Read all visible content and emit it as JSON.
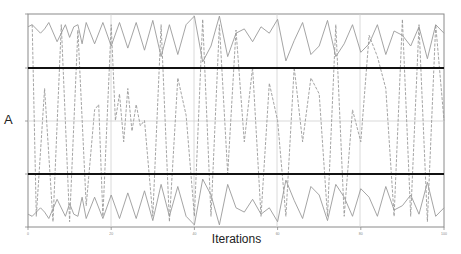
{
  "chart_data": {
    "type": "line",
    "title": "",
    "xlabel": "Iterations",
    "ylabel": "A",
    "xlim": [
      0,
      100
    ],
    "x_ticks": [
      0,
      20,
      40,
      60,
      80,
      100
    ],
    "ylim": [
      -1,
      1
    ],
    "grid": true,
    "legend": null,
    "reference_lines": [
      {
        "name": "upper-threshold",
        "y": 0.5,
        "style": "thick-black"
      },
      {
        "name": "center",
        "y": 0.0,
        "style": "thin-grey"
      },
      {
        "name": "lower-threshold",
        "y": -0.5,
        "style": "thick-black"
      }
    ],
    "series": [
      {
        "name": "upper-band-trace",
        "color": "#9a9a9a",
        "description": "sawtooth oscillation in upper band (A between ~0.55 and ~0.98)",
        "x": [
          0,
          1,
          3,
          4,
          5,
          7,
          9,
          10,
          11,
          12,
          13,
          14,
          16,
          18,
          20,
          22,
          24,
          26,
          28,
          30,
          32,
          34,
          36,
          38,
          40,
          42,
          44,
          46,
          48,
          50,
          52,
          54,
          56,
          58,
          60,
          62,
          64,
          66,
          68,
          70,
          72,
          74,
          76,
          78,
          80,
          82,
          84,
          86,
          88,
          90,
          92,
          94,
          96,
          98,
          100
        ],
        "values": [
          0.88,
          0.9,
          0.82,
          0.86,
          0.92,
          0.74,
          0.9,
          0.78,
          0.88,
          0.9,
          0.72,
          0.92,
          0.72,
          0.92,
          0.7,
          0.92,
          0.68,
          0.92,
          0.66,
          0.94,
          0.6,
          0.9,
          0.62,
          0.9,
          0.98,
          0.55,
          0.7,
          0.98,
          0.6,
          0.82,
          0.86,
          0.74,
          0.88,
          0.82,
          0.95,
          0.56,
          0.75,
          0.92,
          0.62,
          0.7,
          0.94,
          0.6,
          0.72,
          0.9,
          0.64,
          0.72,
          0.9,
          0.62,
          0.84,
          0.8,
          0.7,
          0.88,
          0.58,
          0.9,
          0.82
        ]
      },
      {
        "name": "lower-band-trace",
        "color": "#9a9a9a",
        "description": "mirrored sawtooth oscillation in lower band (A between ~-0.55 and ~-0.98)",
        "x": [
          0,
          1,
          3,
          4,
          5,
          7,
          9,
          10,
          11,
          12,
          13,
          14,
          16,
          18,
          20,
          22,
          24,
          26,
          28,
          30,
          32,
          34,
          36,
          38,
          40,
          42,
          44,
          46,
          48,
          50,
          52,
          54,
          56,
          58,
          60,
          62,
          64,
          66,
          68,
          70,
          72,
          74,
          76,
          78,
          80,
          82,
          84,
          86,
          88,
          90,
          92,
          94,
          96,
          98,
          100
        ],
        "values": [
          -0.88,
          -0.9,
          -0.82,
          -0.86,
          -0.92,
          -0.74,
          -0.9,
          -0.78,
          -0.88,
          -0.9,
          -0.72,
          -0.92,
          -0.72,
          -0.92,
          -0.7,
          -0.92,
          -0.68,
          -0.92,
          -0.66,
          -0.94,
          -0.6,
          -0.9,
          -0.62,
          -0.9,
          -0.98,
          -0.55,
          -0.7,
          -0.98,
          -0.6,
          -0.82,
          -0.86,
          -0.74,
          -0.88,
          -0.82,
          -0.95,
          -0.56,
          -0.75,
          -0.92,
          -0.62,
          -0.7,
          -0.94,
          -0.6,
          -0.72,
          -0.9,
          -0.64,
          -0.72,
          -0.9,
          -0.62,
          -0.84,
          -0.8,
          -0.7,
          -0.88,
          -0.58,
          -0.9,
          -0.82
        ]
      },
      {
        "name": "middle-trace",
        "color": "#9a9a9a",
        "style": "dashed",
        "description": "dashed vertical transitions jumping between the two bands, with some excursions in the middle region",
        "x": [
          1,
          2,
          4,
          6,
          8,
          10,
          12,
          14,
          16,
          17,
          18,
          20,
          21,
          22,
          23,
          24,
          25,
          26,
          27,
          28,
          30,
          32,
          34,
          36,
          38,
          40,
          42,
          44,
          46,
          48,
          50,
          52,
          54,
          56,
          58,
          60,
          62,
          64,
          66,
          68,
          70,
          72,
          74,
          76,
          78,
          80,
          82,
          84,
          86,
          88,
          90,
          92,
          94,
          96,
          98,
          100
        ],
        "values": [
          0.9,
          -0.9,
          0.3,
          -0.95,
          0.9,
          -0.95,
          0.85,
          -0.8,
          0.1,
          0.15,
          -0.9,
          0.9,
          0.0,
          0.25,
          -0.2,
          0.3,
          -0.1,
          0.15,
          -0.05,
          0.0,
          -0.9,
          0.9,
          -0.95,
          0.4,
          0.05,
          -0.9,
          0.95,
          -0.9,
          0.9,
          -0.5,
          0.85,
          -0.2,
          0.5,
          -0.9,
          0.35,
          0.0,
          -0.9,
          0.5,
          -0.2,
          0.4,
          0.25,
          -0.9,
          0.9,
          -0.9,
          0.1,
          -0.2,
          0.8,
          0.6,
          0.3,
          -0.9,
          0.95,
          -0.9,
          0.9,
          -0.95,
          0.9,
          0.0
        ]
      }
    ]
  },
  "axes": {
    "y_label": "A",
    "x_label": "Iterations",
    "x_tick_labels": [
      "0",
      "20",
      "40",
      "60",
      "80",
      "100"
    ]
  },
  "colors": {
    "trace": "#9a9a9a",
    "threshold_lines": "#111111",
    "grid": "#d0d0d0",
    "frame": "#8a8a8a"
  }
}
